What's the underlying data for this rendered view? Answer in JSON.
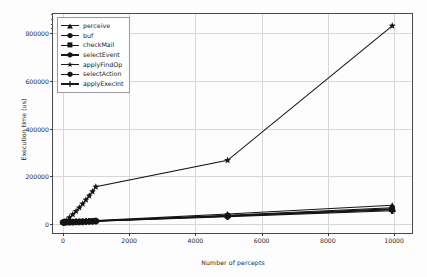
{
  "chart_data": {
    "type": "line",
    "title": "",
    "xlabel": "Number of percepts",
    "ylabel": "Execution time (us)",
    "xlim": [
      -300,
      10600
    ],
    "ylim": [
      -45000,
      880000
    ],
    "xticks": [
      0,
      2000,
      4000,
      6000,
      8000,
      10000
    ],
    "xtick_labels": [
      "0",
      "2000",
      "4000",
      "6000",
      "8000",
      "10000"
    ],
    "yticks": [
      0,
      200000,
      400000,
      600000,
      800000
    ],
    "ytick_labels": [
      "0",
      "200000",
      "400000",
      "600000",
      "800000"
    ],
    "grid": true,
    "legend_position": "upper left",
    "x": [
      10,
      50,
      100,
      200,
      300,
      400,
      500,
      600,
      700,
      800,
      900,
      1000,
      5000,
      10000
    ],
    "series": [
      {
        "name": "perceive",
        "marker": "triangle",
        "values": [
          200,
          400,
          700,
          1200,
          1800,
          2400,
          3100,
          3800,
          4600,
          5500,
          6400,
          7300,
          35000,
          72000
        ]
      },
      {
        "name": "buf",
        "marker": "hexagon",
        "values": [
          150,
          300,
          550,
          1000,
          1500,
          2000,
          2600,
          3200,
          3900,
          4600,
          5400,
          6200,
          30000,
          62000
        ]
      },
      {
        "name": "checkMail",
        "marker": "square",
        "values": [
          100,
          250,
          450,
          800,
          1200,
          1700,
          2200,
          2700,
          3300,
          3900,
          4600,
          5300,
          26000,
          53000
        ]
      },
      {
        "name": "selectEvent",
        "marker": "hexagon",
        "values": [
          120,
          280,
          500,
          900,
          1350,
          1850,
          2400,
          2950,
          3600,
          4250,
          4950,
          5700,
          28000,
          57000
        ]
      },
      {
        "name": "applyFindOp",
        "marker": "star",
        "values": [
          900,
          3500,
          8000,
          20000,
          33000,
          47000,
          62000,
          78000,
          95000,
          112000,
          130000,
          150000,
          262000,
          830000
        ]
      },
      {
        "name": "selectAction",
        "marker": "hexagon",
        "values": [
          110,
          260,
          480,
          850,
          1280,
          1760,
          2280,
          2820,
          3420,
          4050,
          4720,
          5420,
          27000,
          55000
        ]
      },
      {
        "name": "applyExecInt",
        "marker": "plus",
        "values": [
          90,
          220,
          420,
          750,
          1130,
          1550,
          2010,
          2490,
          3020,
          3580,
          4170,
          4800,
          24000,
          49000
        ]
      }
    ],
    "highlight_series": "applyFindOp",
    "highlight_points": [
      {
        "x": 1000,
        "y": 30000
      },
      {
        "x": 5000,
        "y": 262000
      },
      {
        "x": 10000,
        "y": 830000
      }
    ]
  },
  "legend": {
    "items": [
      {
        "label": "perceive",
        "marker": "triangle"
      },
      {
        "label": "buf",
        "marker": "hexagon"
      },
      {
        "label": "checkMail",
        "marker": "square"
      },
      {
        "label": "selectEvent",
        "marker": "hexagon"
      },
      {
        "label": "applyFindOp",
        "marker": "star"
      },
      {
        "label": "selectAction",
        "marker": "hexagon"
      },
      {
        "label": "applyExecInt",
        "marker": "plus"
      }
    ]
  },
  "colors": {
    "line": "#141414",
    "grid": "#d7d7d7",
    "frame": "#4a4a4a",
    "background": "#fdfdfd",
    "text": "#2a2a2a"
  }
}
